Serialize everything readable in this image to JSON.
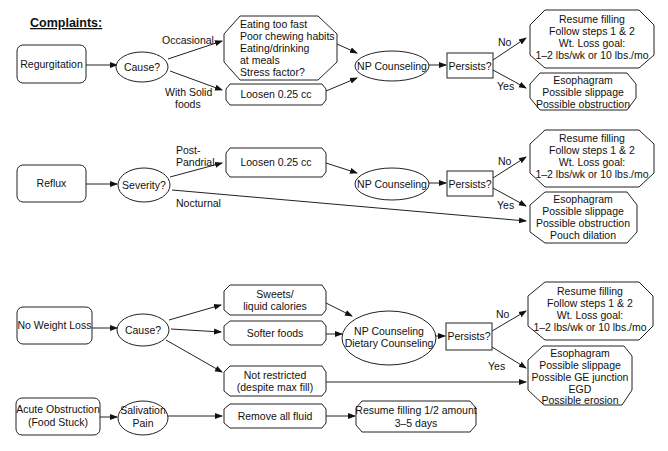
{
  "title": "Complaints:",
  "rows": {
    "regurgitation": {
      "start": "Regurgitation",
      "decision": "Cause?",
      "branch_top_label": "Occasional",
      "branch_bottom_label": [
        "With Solid",
        "foods"
      ],
      "causes_box": [
        "Eating too fast",
        "Poor chewing habits",
        "Eating/drinking",
        "at meals",
        "Stress factor?"
      ],
      "loosen_box": "Loosen 0.25 cc",
      "counseling": "NP Counseling",
      "persists": "Persists?",
      "no_label": "No",
      "yes_label": "Yes",
      "no_outcome": [
        "Resume filling",
        "Follow steps 1 & 2",
        "Wt. Loss goal:",
        "1–2 lbs/wk or 10 lbs./mo"
      ],
      "yes_outcome": [
        "Esophagram",
        "Possible slippage",
        "Possible obstruction"
      ]
    },
    "reflux": {
      "start": "Reflux",
      "decision": "Severity?",
      "branch_top_label": [
        "Post-",
        "Pandrial"
      ],
      "branch_bottom_label": "Nocturnal",
      "loosen_box": "Loosen 0.25 cc",
      "counseling": "NP Counseling",
      "persists": "Persists?",
      "no_label": "No",
      "yes_label": "Yes",
      "no_outcome": [
        "Resume filling",
        "Follow steps 1 & 2",
        "Wt. Loss goal:",
        "1–2 lbs/wk or 10 lbs./mo"
      ],
      "yes_outcome": [
        "Esophagram",
        "Possible slippage",
        "Possible obstruction",
        "Pouch dilation"
      ]
    },
    "no_weight_loss": {
      "start": "No Weight Loss",
      "decision": "Cause?",
      "cause_1": [
        "Sweets/",
        "liquid calories"
      ],
      "cause_2": "Softer foods",
      "cause_3": [
        "Not restricted",
        "(despite max fill)"
      ],
      "counseling": [
        "NP Counseling",
        "Dietary Counseling"
      ],
      "persists": "Persists?",
      "no_label": "No",
      "yes_label": "Yes",
      "no_outcome": [
        "Resume filling",
        "Follow steps 1 & 2",
        "Wt. Loss goal:",
        "1–2 lbs/wk or 10 lbs./mo"
      ],
      "yes_outcome": [
        "Esophagram",
        "Possible slippage",
        "Possible GE junction",
        "EGD",
        "Possible erosion"
      ]
    },
    "acute_obstruction": {
      "start": [
        "Acute Obstruction",
        "(Food Stuck)"
      ],
      "symptom": [
        "Salivation",
        "Pain"
      ],
      "action": "Remove all fluid",
      "outcome": [
        "Resume filling 1/2 amount",
        "3–5 days"
      ]
    }
  }
}
